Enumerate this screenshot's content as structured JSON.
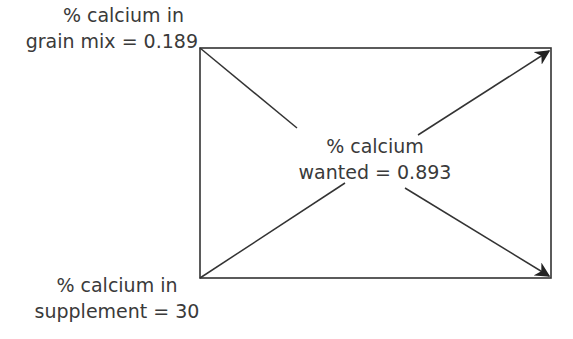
{
  "diagram": {
    "type": "pearson-square",
    "labels": {
      "top_left": {
        "line1": "% calcium in",
        "line2": "grain mix = 0.189"
      },
      "bottom_left": {
        "line1": "% calcium in",
        "line2": "supplement = 30"
      },
      "center": {
        "line1": "% calcium",
        "line2": "wanted = 0.893"
      }
    },
    "values": {
      "grain_mix_calcium_pct": 0.189,
      "supplement_calcium_pct": 30,
      "wanted_calcium_pct": 0.893
    },
    "arrows": [
      {
        "from": "top-left",
        "to": "bottom-right"
      },
      {
        "from": "bottom-left",
        "to": "top-right"
      }
    ],
    "colors": {
      "line": "#333333",
      "text": "#3a3a3a",
      "background": "#ffffff"
    }
  }
}
